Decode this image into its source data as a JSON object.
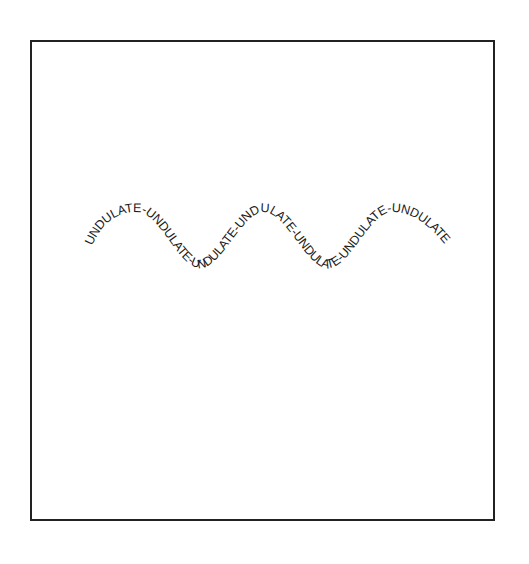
{
  "canvas": {
    "frame": {
      "stroke_color": "#222222",
      "background": "#ffffff"
    }
  },
  "wave": {
    "text": "UNDULATE-UNDULATE-UNDULATE-UNDULATE-UNDULATE-UNDULATE-UNDULATE",
    "repeated_word": "UNDULATE",
    "separator": "-",
    "repeat_count": 7,
    "text_color": "#1a1a1a",
    "path": {
      "shape": "sine",
      "start_x": 92,
      "end_x": 446,
      "center_y": 240,
      "amplitude": 30,
      "period": 127.5,
      "peaks_x": [
        137,
        264,
        392
      ],
      "troughs_x": [
        200,
        328
      ]
    }
  }
}
